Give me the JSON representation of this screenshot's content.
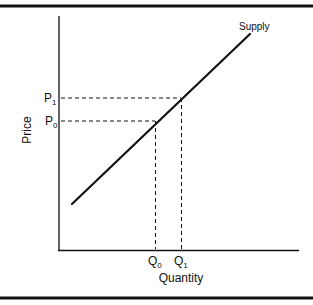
{
  "diagram": {
    "curve_label": "Supply",
    "x_axis_label": "Quantity",
    "y_axis_label": "Price",
    "price_levels": [
      {
        "symbol": "P",
        "subscript": "1"
      },
      {
        "symbol": "P",
        "subscript": "0"
      }
    ],
    "quantity_levels": [
      {
        "symbol": "Q",
        "subscript": "0"
      },
      {
        "symbol": "Q",
        "subscript": "1"
      }
    ],
    "colors": {
      "line": "#111111",
      "background": "#ffffff"
    }
  }
}
